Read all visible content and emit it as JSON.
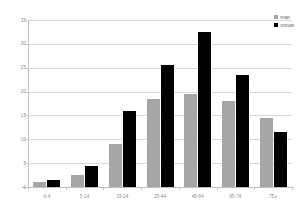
{
  "chart_data": {
    "type": "bar",
    "title": "",
    "subtitle": "",
    "xlabel": "",
    "ylabel": "",
    "ylim": [
      0,
      35
    ],
    "ytick_step": 5,
    "yticks": [
      "0",
      "5",
      "10",
      "15",
      "20",
      "25",
      "30",
      "35"
    ],
    "grid": true,
    "legend_position": "top-right",
    "categories": [
      "0-4",
      "5-14",
      "15-24",
      "25-44",
      "45-64",
      "65-74",
      "75+"
    ],
    "series": [
      {
        "name": "man",
        "color": "#a6a6a6",
        "values": [
          1,
          2.5,
          9,
          18.5,
          19.5,
          18,
          14.5
        ]
      },
      {
        "name": "vrouw",
        "color": "#000000",
        "values": [
          1.5,
          4.5,
          16,
          25.5,
          32.5,
          23.5,
          11.5
        ]
      }
    ]
  },
  "legend": {
    "items": [
      {
        "label": "man",
        "swatch": "man"
      },
      {
        "label": "vrouw",
        "swatch": "vrouw"
      }
    ]
  },
  "colors": {
    "man": "#a6a6a6",
    "vrouw": "#000000",
    "gridline": "#d9d9d9",
    "axis": "#bfbfbf",
    "text": "#8a8a8a",
    "background": "#ffffff"
  }
}
